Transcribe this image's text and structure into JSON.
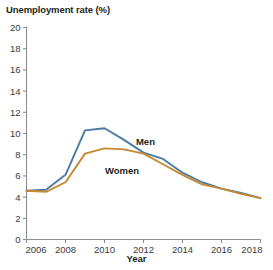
{
  "chart_data": {
    "type": "line",
    "title": "Unemployment rate (%)",
    "xlabel": "Year",
    "ylabel": "Unemployment rate (%)",
    "xlim": [
      2006,
      2018
    ],
    "ylim": [
      0,
      20
    ],
    "xticks": [
      2006,
      2008,
      2010,
      2012,
      2014,
      2016,
      2018
    ],
    "yticks": [
      0,
      2,
      4,
      6,
      8,
      10,
      12,
      14,
      16,
      18,
      20
    ],
    "grid": false,
    "legend_position": "inline-annotation",
    "x": [
      2006,
      2007,
      2008,
      2009,
      2010,
      2011,
      2012,
      2013,
      2014,
      2015,
      2016,
      2017,
      2018
    ],
    "series": [
      {
        "name": "Men",
        "color": "#4a7ba7",
        "values": [
          4.6,
          4.7,
          6.1,
          10.3,
          10.5,
          9.4,
          8.2,
          7.6,
          6.3,
          5.4,
          4.8,
          4.4,
          3.9
        ],
        "label_x": 2012.1,
        "label_y": 9.2
      },
      {
        "name": "Women",
        "color": "#c8892f",
        "values": [
          4.6,
          4.5,
          5.4,
          8.1,
          8.6,
          8.5,
          8.1,
          7.1,
          6.1,
          5.2,
          4.8,
          4.3,
          3.9
        ],
        "label_x": 2010.9,
        "label_y": 6.5
      }
    ]
  },
  "axis": {
    "xtick_labels": [
      "2006",
      "2008",
      "2010",
      "2012",
      "2014",
      "2016",
      "2018"
    ],
    "ytick_labels": [
      "0",
      "2",
      "4",
      "6",
      "8",
      "10",
      "12",
      "14",
      "16",
      "18",
      "20"
    ]
  }
}
